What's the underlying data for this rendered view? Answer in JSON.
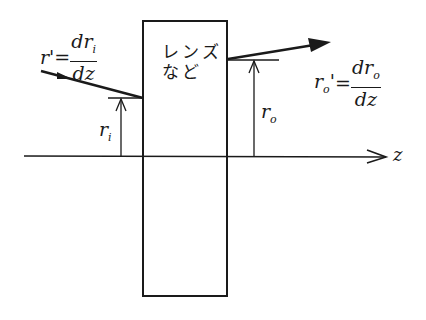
{
  "diagram": {
    "box_label_line1": "レンズ",
    "box_label_line2": "など",
    "input_slope": {
      "lhs": "r'",
      "eq": "=",
      "num": "dr",
      "num_sub": "i",
      "den": "dz"
    },
    "output_slope": {
      "lhs": "r",
      "lhs_sub": "o",
      "lhs_prime": "'",
      "eq": "=",
      "num": "dr",
      "num_sub": "o",
      "den": "dz"
    },
    "input_height": {
      "symbol": "r",
      "sub": "i"
    },
    "output_height": {
      "symbol": "r",
      "sub": "o"
    },
    "axis_label": "z",
    "colors": {
      "ink": "#1a1a1a",
      "background": "#ffffff"
    }
  }
}
